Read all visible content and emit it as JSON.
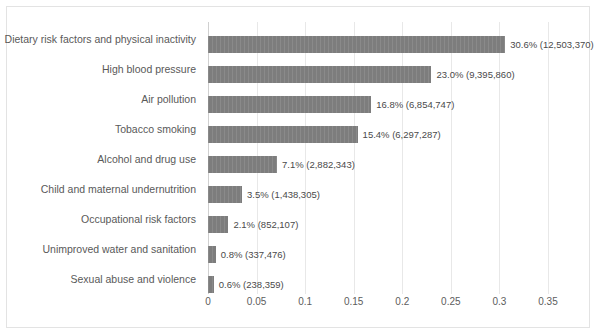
{
  "chart_data": {
    "type": "bar",
    "orientation": "horizontal",
    "title": "",
    "xlabel": "",
    "ylabel": "",
    "xlim": [
      0,
      0.35
    ],
    "grid": true,
    "legend": false,
    "xticks": [
      "0",
      "0.05",
      "0.1",
      "0.15",
      "0.2",
      "0.25",
      "0.3",
      "0.35"
    ],
    "xtick_values": [
      0,
      0.05,
      0.1,
      0.15,
      0.2,
      0.25,
      0.3,
      0.35
    ],
    "categories": [
      "Dietary risk factors and physical inactivity",
      "High blood pressure",
      "Air pollution",
      "Tobacco smoking",
      "Alcohol and drug use",
      "Child and maternal undernutrition",
      "Occupational risk factors",
      "Unimproved water and sanitation",
      "Sexual abuse and violence"
    ],
    "values": [
      0.306,
      0.23,
      0.168,
      0.154,
      0.071,
      0.035,
      0.021,
      0.008,
      0.006
    ],
    "counts": [
      12503370,
      9395860,
      6854747,
      6297287,
      2882343,
      1438305,
      852107,
      337476,
      238359
    ],
    "data_labels": [
      "30.6% (12,503,370)",
      "23.0% (9,395,860)",
      "16.8% (6,854,747)",
      "15.4% (6,297,287)",
      "7.1% (2,882,343)",
      "3.5% (1,438,305)",
      "2.1% (852,107)",
      "0.8% (337,476)",
      "0.6% (238,359)"
    ],
    "colors": {
      "bar": "#7d7d7d",
      "gridline": "#e8e8e8",
      "axis": "#d0d0d0",
      "label_text": "#595959",
      "value_text": "#4a4a4a",
      "border": "#e3e3e3",
      "background": "#ffffff"
    }
  }
}
